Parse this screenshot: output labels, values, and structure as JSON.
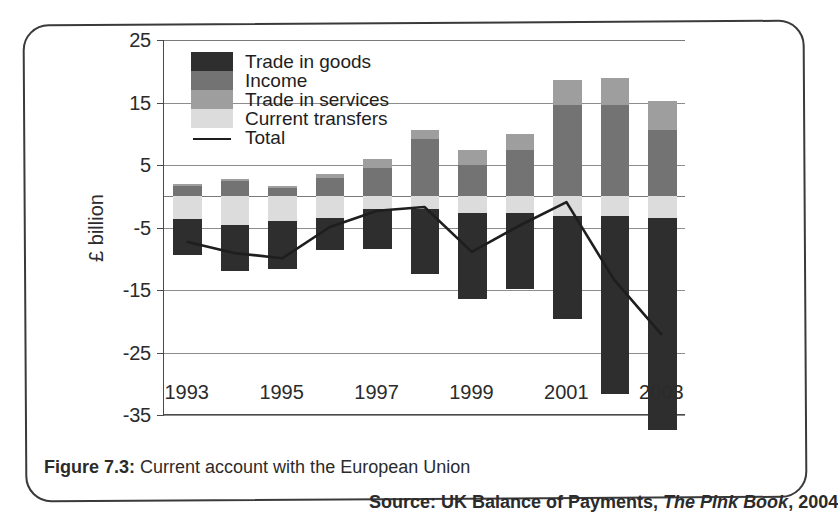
{
  "figure": {
    "caption_prefix": "Figure 7.3:",
    "caption_text": "Current account with the European Union",
    "source_prefix": "Source: UK Balance of Payments,",
    "source_italic": "The Pink Book",
    "source_suffix": ", 2004"
  },
  "colors": {
    "trade_in_goods": "#2e2e2e",
    "income": "#737373",
    "trade_in_services": "#9e9e9e",
    "current_transfers": "#dcdcdc",
    "total_line": "#1e1e1e",
    "gridline": "#8d8d8d",
    "axis": "#4a4a4a",
    "border": "#3a3a3a",
    "background": "#ffffff"
  },
  "chart_data": {
    "type": "bar",
    "subtype": "stacked-bar-with-line-overlay",
    "title": "Current account with the European Union",
    "xlabel": "",
    "ylabel": "£ billion",
    "ylim": [
      -35,
      25
    ],
    "ytick_step": 10,
    "yticks": [
      25,
      15,
      5,
      -5,
      -15,
      -25,
      -35
    ],
    "ytick_labels": [
      "25",
      "15",
      "5",
      "-5",
      "-15",
      "-25",
      "-35"
    ],
    "grid": true,
    "legend_position": "inside-top-left",
    "categories": [
      1993,
      1994,
      1995,
      1996,
      1997,
      1998,
      1999,
      2000,
      2001,
      2002,
      2003
    ],
    "xtick_labels": [
      "1993",
      "1995",
      "1997",
      "1999",
      "2001",
      "2003"
    ],
    "xtick_values": [
      1993,
      1995,
      1997,
      1999,
      2001,
      2003
    ],
    "series": [
      {
        "name": "Trade in goods",
        "color": "#2e2e2e",
        "values": [
          -5.8,
          -7.4,
          -7.6,
          -5.2,
          -6.4,
          -10.4,
          -13.8,
          -12.2,
          -16.4,
          -28.4,
          -34.0
        ]
      },
      {
        "name": "Income",
        "color": "#737373",
        "values": [
          1.6,
          2.4,
          1.4,
          3.0,
          4.6,
          9.2,
          5.0,
          7.4,
          14.6,
          14.6,
          10.6
        ]
      },
      {
        "name": "Trade in services",
        "color": "#9e9e9e",
        "values": [
          0.4,
          0.4,
          0.2,
          0.6,
          1.4,
          1.4,
          2.4,
          2.6,
          4.0,
          4.4,
          4.6
        ]
      },
      {
        "name": "Current transfers",
        "color": "#dcdcdc",
        "values": [
          -3.6,
          -4.6,
          -4.0,
          -3.4,
          -2.0,
          -2.0,
          -2.6,
          -2.6,
          -3.2,
          -3.2,
          -3.4
        ]
      }
    ],
    "total_line": {
      "name": "Total",
      "color": "#1e1e1e",
      "values": [
        -7.4,
        -9.2,
        -10.0,
        -5.0,
        -2.4,
        -1.8,
        -9.0,
        -4.8,
        -1.0,
        -13.4,
        -22.2
      ]
    }
  },
  "legend": {
    "items": [
      {
        "label": "Trade in goods",
        "swatch": "goods"
      },
      {
        "label": "Income",
        "swatch": "income"
      },
      {
        "label": "Trade in services",
        "swatch": "services"
      },
      {
        "label": "Current transfers",
        "swatch": "transfers"
      },
      {
        "label": "Total",
        "swatch": "total"
      }
    ]
  }
}
